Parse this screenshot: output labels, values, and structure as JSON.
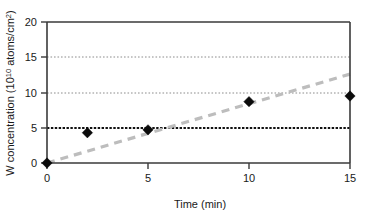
{
  "chart_data": {
    "type": "scatter",
    "title": "",
    "xlabel": "Time (min)",
    "ylabel": "W concentration (10¹⁰ atoms/cm²)",
    "ylabel_parts": {
      "prefix": "W concentration (10",
      "exponent": "10",
      "suffix": " atoms/cm",
      "suffix_exponent": "2",
      "close": ")"
    },
    "xlim": [
      0,
      15
    ],
    "ylim": [
      0,
      20
    ],
    "xticks": [
      0,
      5,
      10,
      15
    ],
    "xtick_labels": [
      "0",
      "5",
      "10",
      "15"
    ],
    "yticks": [
      0,
      5,
      10,
      15,
      20
    ],
    "ytick_labels": [
      "0",
      "5",
      "10",
      "15",
      "20"
    ],
    "grid": true,
    "gridlines": [
      {
        "value": 15,
        "style": "dotted",
        "color": "#8c8c8c",
        "weight": "light"
      },
      {
        "value": 10,
        "style": "dotted",
        "color": "#8c8c8c",
        "weight": "light"
      },
      {
        "value": 5,
        "style": "dashed",
        "color": "#111111",
        "weight": "heavy"
      }
    ],
    "legend": null,
    "series": [
      {
        "name": "W concentration",
        "type": "scatter",
        "marker": "diamond",
        "color": "#0b0b0b",
        "x": [
          0,
          2,
          5,
          10,
          15
        ],
        "values": [
          0.0,
          4.3,
          4.7,
          8.7,
          9.5
        ],
        "points": [
          {
            "x": 0,
            "y": 0.0
          },
          {
            "x": 2,
            "y": 4.3
          },
          {
            "x": 5,
            "y": 4.7
          },
          {
            "x": 10,
            "y": 8.7
          },
          {
            "x": 15,
            "y": 9.5
          }
        ]
      },
      {
        "name": "Trend line",
        "type": "line",
        "style": "dashed",
        "color": "#bdbdbd",
        "x": [
          0,
          15
        ],
        "values": [
          0.0,
          12.6
        ]
      }
    ]
  },
  "figure": {
    "background": "#ffffff",
    "axis_color": "#3a3a3a",
    "marker_color": "#0b0b0b",
    "trend_color": "#bdbdbd",
    "grid_color": "#8c8c8c"
  }
}
